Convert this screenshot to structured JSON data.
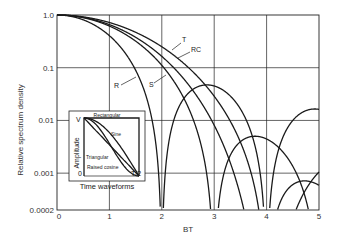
{
  "chart_data": {
    "type": "line",
    "title": "",
    "xlabel": "BT",
    "ylabel": "Relative spectrum density",
    "xlim": [
      0,
      5
    ],
    "ylim": [
      0.0002,
      1.0
    ],
    "yscale": "log",
    "x_ticks": [
      "0",
      "1",
      "2",
      "3",
      "4",
      "5"
    ],
    "y_ticks": [
      "1.0",
      "0.1",
      "0.01",
      "0.001",
      "0.0002"
    ],
    "grid": true,
    "series": [
      {
        "name": "R",
        "label": "R",
        "shape": "Rectangular",
        "nulls": [
          2,
          4
        ]
      },
      {
        "name": "S",
        "label": "S",
        "shape": "Sine",
        "nulls": [
          3
        ]
      },
      {
        "name": "T",
        "label": "T",
        "shape": "Triangular",
        "nulls": [
          4
        ]
      },
      {
        "name": "RC",
        "label": "RC",
        "shape": "Raised cosine",
        "nulls": [
          3,
          4
        ]
      }
    ],
    "inset": {
      "title": "Time waveforms",
      "ylabel": "Amplitude",
      "y_top": "V",
      "y_bottom": "0",
      "x_end": "T/2",
      "labels": [
        "Rectangular",
        "Sine",
        "Triangular",
        "Raised cosine"
      ]
    }
  }
}
